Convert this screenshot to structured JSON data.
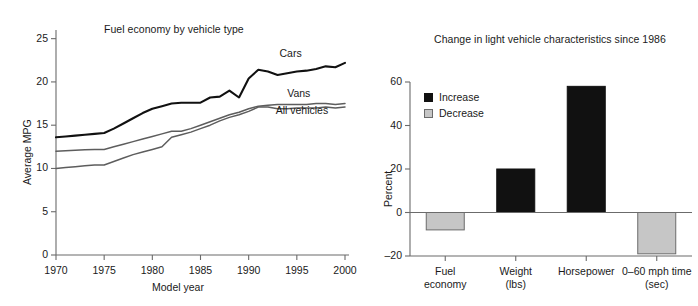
{
  "figure": {
    "background": "#ffffff",
    "width": 698,
    "height": 306
  },
  "chart_data": [
    {
      "type": "line",
      "id": "fuel-economy-by-vehicle-type",
      "title": "Fuel economy by vehicle type",
      "xlabel": "Model year",
      "ylabel": "Average MPG",
      "xlim": [
        1970,
        2000
      ],
      "ylim": [
        0,
        26
      ],
      "xticks": [
        1970,
        1975,
        1980,
        1985,
        1990,
        1995,
        2000
      ],
      "xticklabels": [
        "1970",
        "1975",
        "1980",
        "1985",
        "1990",
        "1995",
        "2000"
      ],
      "yticks": [
        0,
        5,
        10,
        15,
        20,
        25
      ],
      "yticklabels": [
        "0",
        "5",
        "10",
        "15",
        "20",
        "25"
      ],
      "grid": false,
      "legend_position": "inline-right-of-lines",
      "x": [
        1970,
        1971,
        1972,
        1973,
        1974,
        1975,
        1976,
        1977,
        1978,
        1979,
        1980,
        1981,
        1982,
        1983,
        1984,
        1985,
        1986,
        1987,
        1988,
        1989,
        1990,
        1991,
        1992,
        1993,
        1994,
        1995,
        1996,
        1997,
        1998,
        1999,
        2000
      ],
      "series": [
        {
          "name": "Cars",
          "color": "#111111",
          "linewidth": 2.1,
          "label_x": 1993.2,
          "label_y": 23.2,
          "values": [
            13.6,
            13.7,
            13.8,
            13.9,
            14.0,
            14.1,
            14.6,
            15.2,
            15.8,
            16.4,
            16.9,
            17.2,
            17.5,
            17.6,
            17.6,
            17.6,
            18.2,
            18.3,
            19.0,
            18.2,
            20.4,
            21.4,
            21.2,
            20.8,
            21.0,
            21.2,
            21.3,
            21.5,
            21.8,
            21.7,
            22.2
          ]
        },
        {
          "name": "Vans",
          "color": "#5d5d5d",
          "linewidth": 1.5,
          "label_x": 1994.0,
          "label_y": 18.6,
          "values": [
            12.0,
            12.05,
            12.1,
            12.15,
            12.2,
            12.2,
            12.5,
            12.8,
            13.1,
            13.4,
            13.7,
            14.0,
            14.3,
            14.3,
            14.6,
            15.0,
            15.4,
            15.8,
            16.2,
            16.5,
            16.9,
            17.2,
            17.3,
            17.4,
            17.4,
            17.4,
            17.4,
            17.5,
            17.5,
            17.4,
            17.5
          ]
        },
        {
          "name": "All vehicles",
          "color": "#5d5d5d",
          "linewidth": 1.5,
          "label_x": 1992.8,
          "label_y": 16.6,
          "values": [
            10.0,
            10.1,
            10.2,
            10.3,
            10.4,
            10.4,
            10.8,
            11.2,
            11.6,
            11.9,
            12.2,
            12.5,
            13.6,
            13.9,
            14.2,
            14.6,
            15.0,
            15.5,
            15.9,
            16.2,
            16.6,
            17.1,
            17.1,
            16.9,
            16.9,
            17.0,
            17.0,
            17.0,
            17.1,
            17.0,
            17.1
          ]
        }
      ]
    },
    {
      "type": "bar",
      "id": "change-in-light-vehicle-characteristics",
      "title": "Change in light vehicle characteristics since 1986",
      "xlabel": "",
      "ylabel": "Percent",
      "ylim": [
        -20,
        62
      ],
      "yticks": [
        -20,
        0,
        20,
        40,
        60
      ],
      "yticklabels": [
        "–20",
        "0",
        "20",
        "40",
        "60"
      ],
      "grid": false,
      "legend_position": "upper-left",
      "legend": [
        {
          "label": "Increase",
          "color": "#111111"
        },
        {
          "label": "Decrease",
          "color": "#c6c6c6"
        }
      ],
      "categories": [
        "Fuel economy",
        "Weight (lbs)",
        "Horsepower",
        "0–60 mph time (sec)"
      ],
      "category_lines": [
        [
          "Fuel",
          "economy"
        ],
        [
          "Weight",
          "(lbs)"
        ],
        [
          "Horsepower",
          ""
        ],
        [
          "0–60 mph time",
          "(sec)"
        ]
      ],
      "values": [
        -8,
        20,
        58,
        -19
      ],
      "bar_colors": [
        "#c6c6c6",
        "#111111",
        "#111111",
        "#c6c6c6"
      ]
    }
  ]
}
